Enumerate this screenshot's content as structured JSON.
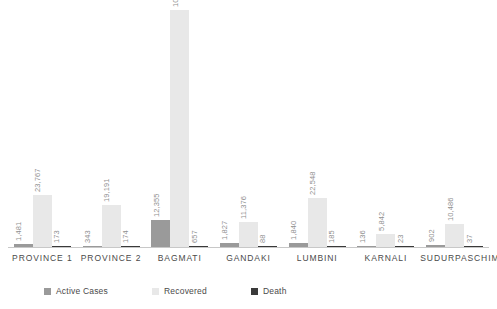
{
  "chart_data": {
    "type": "bar",
    "title": "",
    "subtitle": "",
    "xlabel": "",
    "ylabel": "",
    "grid": false,
    "axis_visible": {
      "x": true,
      "y": false
    },
    "ylim": [
      0,
      108857
    ],
    "legend_position": "bottom-left",
    "categories": [
      "PROVINCE 1",
      "PROVINCE 2",
      "BAGMATI",
      "GANDAKI",
      "LUMBINI",
      "KARNALI",
      "SUDURPASCHIM"
    ],
    "series": [
      {
        "name": "Active Cases",
        "color": "#9a9a9a",
        "values": [
          1481,
          343,
          12355,
          1827,
          1840,
          136,
          902
        ],
        "labels": [
          "1,481",
          "343",
          "12,355",
          "1,827",
          "1,840",
          "136",
          "902"
        ]
      },
      {
        "name": "Recovered",
        "color": "#e8e8e8",
        "values": [
          23767,
          19191,
          108857,
          11376,
          22548,
          5842,
          10486
        ],
        "labels": [
          "23,767",
          "19,191",
          "108,857",
          "11,376",
          "22,548",
          "5,842",
          "10,486"
        ]
      },
      {
        "name": "Death",
        "color": "#3a3a3a",
        "values": [
          173,
          174,
          657,
          88,
          185,
          23,
          37
        ],
        "labels": [
          "173",
          "174",
          "657",
          "88",
          "185",
          "23",
          "37"
        ]
      }
    ]
  },
  "legend": {
    "items": [
      {
        "label": "Active Cases",
        "color": "#9a9a9a"
      },
      {
        "label": "Recovered",
        "color": "#e8e8e8"
      },
      {
        "label": "Death",
        "color": "#3a3a3a"
      }
    ]
  }
}
